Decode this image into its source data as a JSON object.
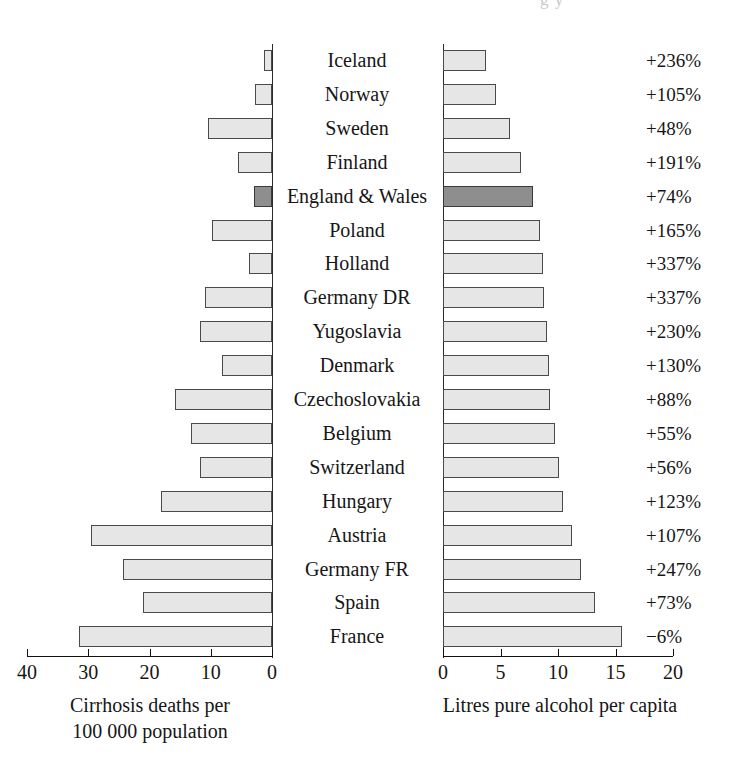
{
  "header": {
    "cut_off_text": "g y"
  },
  "chart_data": {
    "type": "bar",
    "title": "",
    "subtitle": "",
    "orientation": "horizontal-diverging",
    "grid": false,
    "legend_position": "none",
    "categories": [
      "Iceland",
      "Norway",
      "Sweden",
      "Finland",
      "England & Wales",
      "Poland",
      "Holland",
      "Germany DR",
      "Yugoslavia",
      "Denmark",
      "Czechoslovakia",
      "Belgium",
      "Switzerland",
      "Hungary",
      "Austria",
      "Germany FR",
      "Spain",
      "France"
    ],
    "highlight_category": "England & Wales",
    "panels": [
      {
        "id": "cirrhosis",
        "side": "left",
        "xlabel": "Cirrhosis deaths per 100 000 population",
        "xlabel_line1": "Cirrhosis deaths per",
        "xlabel_line2": "100 000 population",
        "ticks": [
          40,
          30,
          20,
          10,
          0
        ],
        "tick_labels": [
          "40",
          "30",
          "20",
          "10",
          "0"
        ],
        "xlim": [
          40,
          0
        ],
        "values": [
          1.3,
          2.8,
          10.5,
          5.6,
          2.9,
          9.8,
          3.8,
          11.0,
          11.8,
          8.2,
          15.8,
          13.2,
          11.7,
          18.2,
          29.5,
          24.3,
          21.0,
          31.5
        ]
      },
      {
        "id": "alcohol",
        "side": "right",
        "xlabel": "Litres pure alcohol per capita",
        "ticks": [
          0,
          5,
          10,
          15,
          20
        ],
        "tick_labels": [
          "0",
          "5",
          "10",
          "15",
          "20"
        ],
        "xlim": [
          0,
          20
        ],
        "values": [
          3.7,
          4.6,
          5.8,
          6.8,
          7.8,
          8.4,
          8.7,
          8.8,
          9.0,
          9.2,
          9.3,
          9.7,
          10.1,
          10.4,
          11.2,
          12.0,
          13.2,
          15.6
        ]
      }
    ],
    "annotations": {
      "column_name": "percent change",
      "values": [
        "+236%",
        "+105%",
        "+48%",
        "+191%",
        "+74%",
        "+165%",
        "+337%",
        "+337%",
        "+230%",
        "+130%",
        "+88%",
        "+55%",
        "+56%",
        "+123%",
        "+107%",
        "+247%",
        "+73%",
        "−6%"
      ]
    }
  },
  "colors": {
    "bar_fill": "#e6e6e6",
    "bar_stroke": "#4a4a4a",
    "highlight_fill": "#8e8e8e",
    "axis": "#111111",
    "text": "#161616",
    "background": "#ffffff"
  }
}
